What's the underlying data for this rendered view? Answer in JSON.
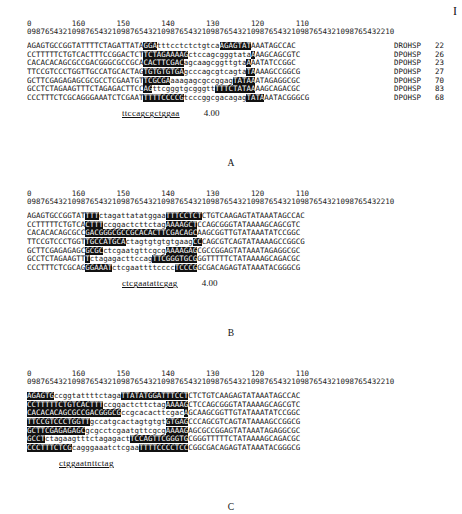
{
  "page": {
    "number_fragment": "I"
  },
  "ruler": {
    "tens": "0         160       150       140       130       120       110",
    "units": "0987654321098765432109876543210987654321098765432109876543210987654321098765432210"
  },
  "panels": [
    {
      "letter": "A",
      "consensus": "ttccagcgctggaa",
      "score": "4.00",
      "rows": [
        {
          "segs": [
            [
              "AGAGTGCCGGTATTTTCTAGATTATA",
              ""
            ],
            [
              "GGA",
              "hl"
            ],
            [
              "tttcctctctgtca",
              ""
            ],
            [
              "AGAGTAT",
              "hl"
            ],
            [
              "AAATAGCCAC",
              ""
            ]
          ],
          "label": "DROHSP",
          "count": "22"
        },
        {
          "segs": [
            [
              "CCTTTTTCTGTCACTTTCCGGACTCT",
              ""
            ],
            [
              "TCTAGAAAAG",
              "hl"
            ],
            [
              "ctccagcgggtata",
              ""
            ],
            [
              "A",
              "hl"
            ],
            [
              "AAGCAGCGTC",
              ""
            ]
          ],
          "label": "DPOHSP",
          "count": "26"
        },
        {
          "segs": [
            [
              "CACACACAGCGCCGACGGGCGCCGCA",
              ""
            ],
            [
              "CACTTCGAC",
              "hl"
            ],
            [
              "agcaagcggttgta",
              ""
            ],
            [
              "A",
              "hl"
            ],
            [
              "AATATCCGGC",
              ""
            ]
          ],
          "label": "DPOHSP",
          "count": "23"
        },
        {
          "segs": [
            [
              "TTCCGTCCCTGGTTGCCATGCACTAG",
              ""
            ],
            [
              "TGTGTGTGA",
              "hl"
            ],
            [
              "gcccagcgtcagta",
              ""
            ],
            [
              "TA",
              "hl"
            ],
            [
              "AAAGCCGGCG",
              ""
            ]
          ],
          "label": "DPOHSP",
          "count": "27"
        },
        {
          "segs": [
            [
              "GCTTCGAGAGAGCGCGCCTCGAATGT",
              ""
            ],
            [
              "TCGCGA",
              "hl"
            ],
            [
              "aaagagcgccggag",
              ""
            ],
            [
              "TATAA",
              "hl"
            ],
            [
              "ATAGAGGCGC",
              ""
            ]
          ],
          "label": "DPOHSP",
          "count": "70"
        },
        {
          "segs": [
            [
              "GCCTCTAGAAGTTTCTAGAGACTTCC",
              ""
            ],
            [
              "AG",
              "hl"
            ],
            [
              "ttcgggtgcgggtt",
              ""
            ],
            [
              "TTTCTATAA",
              "hl"
            ],
            [
              "AAGCAGACGC",
              ""
            ]
          ],
          "label": "DPOHSP",
          "count": "83"
        },
        {
          "segs": [
            [
              "CCCTTTCTCGCAGGGAAATCTCGAAT",
              ""
            ],
            [
              "TTTTCCCCG",
              "hl"
            ],
            [
              "tcccggcgacagag",
              ""
            ],
            [
              "TATA",
              "hl"
            ],
            [
              "AATACGGGCG",
              ""
            ]
          ],
          "label": "DPOHSP",
          "count": "68"
        }
      ]
    },
    {
      "letter": "B",
      "consensus": "ctcgaatattcgag",
      "score": "4.00",
      "rows": [
        {
          "segs": [
            [
              "AGAGTGCCGGTAT",
              ""
            ],
            [
              "TTT",
              "hl"
            ],
            [
              "ctagattatatggaa",
              ""
            ],
            [
              "TTTCCTCT",
              "hl"
            ],
            [
              "CTGTCAAGAGTATAAATAGCCAC",
              ""
            ]
          ]
        },
        {
          "segs": [
            [
              "CCTTTTTCTGTCA",
              ""
            ],
            [
              "CTTT",
              "hl"
            ],
            [
              "ccggactcttctag",
              ""
            ],
            [
              "AAAAGCT",
              "hl"
            ],
            [
              "CCAGCGGGTATAAAAGCAGCGTC",
              ""
            ]
          ]
        },
        {
          "segs": [
            [
              "CACACACAGCGCC",
              ""
            ],
            [
              "GACGGGCGCCGCACACTTCGACAGC",
              "hl"
            ],
            [
              "AAGCGGTTGTATAAATATCCGGC",
              ""
            ]
          ]
        },
        {
          "segs": [
            [
              "TTCCGTCCCTGGT",
              ""
            ],
            [
              "TGCCATGCA",
              "hl"
            ],
            [
              "ctagtgtgtgtgaag",
              ""
            ],
            [
              "CC",
              "hl"
            ],
            [
              "CAGCGTCAGTATAAAAGCCGGCG",
              ""
            ]
          ]
        },
        {
          "segs": [
            [
              "GCTTCGAGAGAGC",
              ""
            ],
            [
              "GCGC",
              "hl"
            ],
            [
              "ctcgaatgttcgcg",
              ""
            ],
            [
              "AAAAGAG",
              "hl"
            ],
            [
              "CGCCGGAGTATAAATAGAGGCGC",
              ""
            ]
          ]
        },
        {
          "segs": [
            [
              "GCCTCTAGAAGTT",
              ""
            ],
            [
              "T",
              "hl"
            ],
            [
              "ctagagacttccag",
              ""
            ],
            [
              "TTCGGGTGCG",
              "hl"
            ],
            [
              "GGTTTTTCTATAAAAGCAGACGC",
              ""
            ]
          ]
        },
        {
          "segs": [
            [
              "CCCTTTCTCGCAG",
              ""
            ],
            [
              "GGAAAT",
              "hl"
            ],
            [
              "ctcgaattttcccc",
              ""
            ],
            [
              "TCCCG",
              "hl"
            ],
            [
              "GCGACAGAGTATAAATACGGGCG",
              ""
            ]
          ]
        }
      ]
    },
    {
      "letter": "C",
      "consensus": "ctggaatnttctag",
      "score": "",
      "rows": [
        {
          "segs": [
            [
              "AGAGTG",
              "hl"
            ],
            [
              "ccggtattttctaga",
              ""
            ],
            [
              "TTATATGGATTTCCT",
              "hl"
            ],
            [
              "CTCTGTCAAGAGTATAAATAGCCAC",
              ""
            ]
          ]
        },
        {
          "segs": [
            [
              "CCTTTTTCTGTCACTTT",
              "hl"
            ],
            [
              "ccggactcttctag",
              ""
            ],
            [
              "AAAAG",
              "hl"
            ],
            [
              "CTCCAGCGGGTATAAAAGCAGCGTC",
              ""
            ]
          ]
        },
        {
          "segs": [
            [
              "CACACACAGCGCCGACGGGCG",
              "hl"
            ],
            [
              "ccgcacacttcgac",
              ""
            ],
            [
              "A",
              "hl"
            ],
            [
              "GCAAGCGGTTGTATAAATATCCGGC",
              ""
            ]
          ]
        },
        {
          "segs": [
            [
              "TTCCGTCCCTGGTT",
              "hl"
            ],
            [
              "gccatgcactagtgtgt",
              ""
            ],
            [
              "GTGAG",
              "hl"
            ],
            [
              "CCCAGCGTCAGTATAAAAGCCGGCG",
              ""
            ]
          ]
        },
        {
          "segs": [
            [
              "GCTTCGAGAGAGC",
              "hl"
            ],
            [
              "gcgcctcgaatgttcgcg",
              ""
            ],
            [
              "AAAAG",
              "hl"
            ],
            [
              "AGCGCCGGAGTATAAATAGAGGCGC",
              ""
            ]
          ]
        },
        {
          "segs": [
            [
              "GCCT",
              "hl"
            ],
            [
              "ctagaagtttctagagact",
              ""
            ],
            [
              "TCCAGTTCGGGTG",
              "hl"
            ],
            [
              "CGGGTTTTTCTATAAAAGCAGACGC",
              ""
            ]
          ]
        },
        {
          "segs": [
            [
              "CCCTTTCTCG",
              "hl"
            ],
            [
              "cagggaaatctcgaa",
              ""
            ],
            [
              "TTTTCCCCTCC",
              "hl"
            ],
            [
              "CGGCGACAGAGTATAAATACGGGCG",
              ""
            ]
          ]
        }
      ]
    }
  ]
}
